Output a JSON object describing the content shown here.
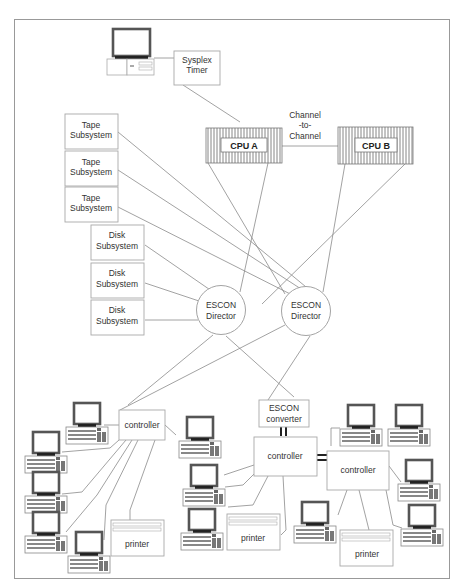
{
  "diagram": {
    "title": "",
    "nodes": {
      "sysplex_timer": {
        "line1": "Sysplex",
        "line2": "Timer"
      },
      "cpu_a": {
        "label": "CPU  A"
      },
      "cpu_b": {
        "label": "CPU B"
      },
      "ctc": {
        "line1": "Channel",
        "line2": "-to-",
        "line3": "Channel"
      },
      "tape": [
        {
          "line1": "Tape",
          "line2": "Subsystem"
        },
        {
          "line1": "Tape",
          "line2": "Subsystem"
        },
        {
          "line1": "Tape",
          "line2": "Subsystem"
        }
      ],
      "disk": [
        {
          "line1": "Disk",
          "line2": "Subsystem"
        },
        {
          "line1": "Disk",
          "line2": "Subsystem"
        },
        {
          "line1": "Disk",
          "line2": "Subsystem"
        }
      ],
      "director_1": {
        "line1": "ESCON",
        "line2": "Director"
      },
      "director_2": {
        "line1": "ESCON",
        "line2": "Director"
      },
      "converter": {
        "line1": "ESCON",
        "line2": "converter"
      },
      "controllers": [
        {
          "label": "controller"
        },
        {
          "label": "controller"
        },
        {
          "label": "controller"
        }
      ],
      "printers": [
        {
          "label": "printer"
        },
        {
          "label": "printer"
        },
        {
          "label": "printer"
        }
      ]
    },
    "colors": {
      "line": "#8a8a8a",
      "box_border": "#a8a8a8",
      "monitor_frame": "#5a5a5a",
      "text": "#333333"
    }
  }
}
